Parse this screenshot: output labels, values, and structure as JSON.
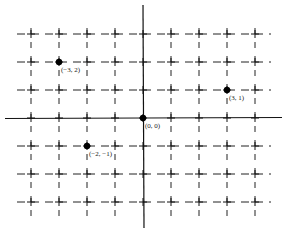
{
  "diagram": {
    "type": "coordinate-plane",
    "origin_px": [
      143,
      118
    ],
    "unit_px": 28,
    "x_range": [
      -4,
      4
    ],
    "y_range": [
      -3,
      3
    ],
    "grid_style": "dashed",
    "axis_color": "#111111",
    "grid_color": "#222222",
    "points": [
      {
        "x": -3,
        "y": 2,
        "label": "(−3, 2)"
      },
      {
        "x": 3,
        "y": 1,
        "label": "(3, 1)"
      },
      {
        "x": 0,
        "y": 0,
        "label": "(0, 0)"
      },
      {
        "x": -2,
        "y": -1,
        "label": "(−2, −1)"
      }
    ]
  }
}
